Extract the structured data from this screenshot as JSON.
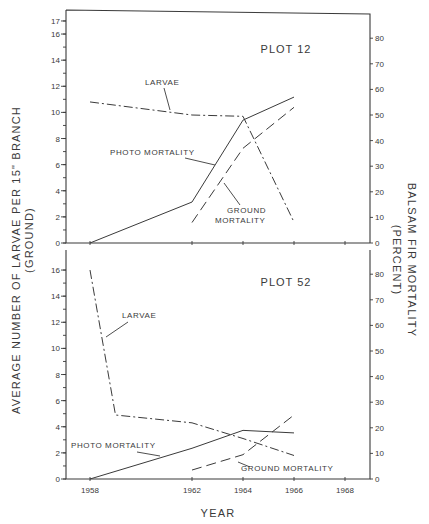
{
  "chart_data": [
    {
      "type": "line",
      "title": "PLOT 12",
      "xlabel": "YEAR",
      "ylabel_left": "AVERAGE NUMBER OF LARVAE PER 15\" BRANCH (GROUND)",
      "ylabel_right": "BALSAM FIR MORTALITY (PERCENT)",
      "x_ticks": [
        1958,
        1962,
        1964,
        1966,
        1968
      ],
      "ylim_left": [
        0,
        17
      ],
      "ylim_right": [
        0,
        80
      ],
      "left_ticks": [
        0,
        2,
        4,
        6,
        8,
        10,
        12,
        14,
        16,
        17
      ],
      "right_ticks": [
        0,
        10,
        20,
        30,
        40,
        50,
        60,
        70,
        80
      ],
      "grid": false,
      "series": [
        {
          "name": "LARVAE",
          "axis": "left",
          "style": "dash-dot",
          "x": [
            1958,
            1962,
            1964,
            1966
          ],
          "values": [
            10.8,
            9.8,
            9.7,
            1.6
          ]
        },
        {
          "name": "PHOTO MORTALITY",
          "axis": "right",
          "style": "solid",
          "x": [
            1958,
            1962,
            1964,
            1966
          ],
          "values": [
            0,
            16,
            48,
            57
          ]
        },
        {
          "name": "GROUND MORTALITY",
          "axis": "right",
          "style": "dashed",
          "x": [
            1962,
            1964,
            1966
          ],
          "values": [
            8,
            37,
            53
          ]
        }
      ]
    },
    {
      "type": "line",
      "title": "PLOT 52",
      "xlabel": "YEAR",
      "ylabel_left": "AVERAGE NUMBER OF LARVAE PER 15\" BRANCH (GROUND)",
      "ylabel_right": "BALSAM FIR MORTALITY (PERCENT)",
      "x_ticks": [
        1958,
        1962,
        1964,
        1966,
        1968
      ],
      "ylim_left": [
        0,
        16
      ],
      "ylim_right": [
        0,
        80
      ],
      "left_ticks": [
        0,
        2,
        4,
        6,
        8,
        10,
        12,
        14,
        16
      ],
      "right_ticks": [
        0,
        10,
        20,
        30,
        40,
        50,
        60,
        70,
        80
      ],
      "grid": false,
      "series": [
        {
          "name": "LARVAE",
          "axis": "left",
          "style": "dash-dot",
          "x": [
            1958,
            1959,
            1962,
            1964,
            1966
          ],
          "values": [
            16,
            4.9,
            4.3,
            3.1,
            1.8
          ]
        },
        {
          "name": "PHOTO MORTALITY",
          "axis": "right",
          "style": "solid",
          "x": [
            1958,
            1962,
            1964,
            1966
          ],
          "values": [
            0,
            12,
            19,
            18
          ]
        },
        {
          "name": "GROUND MORTALITY",
          "axis": "right",
          "style": "dashed",
          "x": [
            1962,
            1964,
            1966
          ],
          "values": [
            3.5,
            9.5,
            25
          ]
        }
      ]
    }
  ],
  "labels": {
    "plot12_title": "PLOT 12",
    "plot52_title": "PLOT 52",
    "larvae": "LARVAE",
    "photo_mortality": "PHOTO MORTALITY",
    "ground": "GROUND",
    "mortality": "MORTALITY",
    "ground_mortality": "GROUND MORTALITY",
    "x_axis_title": "YEAR",
    "left_axis_title_line1": "AVERAGE NUMBER OF LARVAE PER 15\" BRANCH",
    "left_axis_title_line2": "(GROUND)",
    "right_axis_title_line1": "BALSAM FIR MORTALITY",
    "right_axis_title_line2": "(PERCENT)"
  },
  "ticks": {
    "top_left": [
      "0",
      "2",
      "4",
      "6",
      "8",
      "10",
      "12",
      "14",
      "16",
      "17"
    ],
    "bottom_left": [
      "0",
      "2",
      "4",
      "6",
      "8",
      "10",
      "12",
      "14",
      "16"
    ],
    "right": [
      "0",
      "10",
      "20",
      "30",
      "40",
      "50",
      "60",
      "70",
      "80"
    ],
    "x": [
      "1958",
      "1962",
      "1964",
      "1966",
      "1968"
    ]
  }
}
